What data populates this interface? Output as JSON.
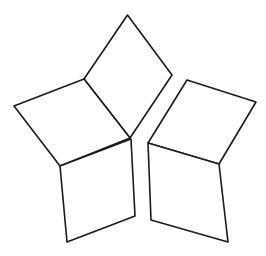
{
  "diagram": {
    "type": "line-drawing",
    "width": 266,
    "height": 256,
    "background": "#ffffff",
    "stroke_color": "#1a1a1a",
    "shapes": [
      {
        "name": "top-rhombus",
        "points": "127.5,15 172,75 130,138 84,79"
      },
      {
        "name": "upper-left-rhombus",
        "points": "84,79 130,138 60,166 14,106"
      },
      {
        "name": "lower-left-rhombus",
        "points": "60,166 131,139 135,216 67,242"
      },
      {
        "name": "upper-right-rhombus",
        "points": "187,80 256,102 219,164 148,143"
      },
      {
        "name": "lower-right-rhombus",
        "points": "148,143 219,164 228,242 151,220"
      }
    ]
  }
}
